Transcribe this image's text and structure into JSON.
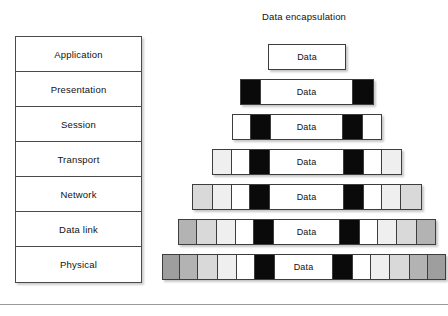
{
  "diagram": {
    "title": "Data encapsulation",
    "osi_stack": {
      "name": "OSI layer stack",
      "layers": [
        {
          "label": "Application"
        },
        {
          "label": "Presentation"
        },
        {
          "label": "Session"
        },
        {
          "label": "Transport"
        },
        {
          "label": "Network"
        },
        {
          "label": "Data link"
        },
        {
          "label": "Physical"
        }
      ]
    },
    "data_label": "Data",
    "colors": {
      "header_black": "#0a0a0a",
      "header_white": "#ffffff",
      "header_gray_light": "#efefef",
      "header_gray_mid": "#d9d9d9",
      "header_gray_dark": "#b3b3b3",
      "header_gray_darker": "#9e9e9e",
      "outline": "#3d3d3d",
      "background": "#ffffff"
    },
    "encapsulation_rows": [
      {
        "layer": "Application",
        "data_label": "Data",
        "left": 108,
        "width": 78,
        "top": 6,
        "segments_left": [],
        "segments_right": []
      },
      {
        "layer": "Presentation",
        "data_label": "Data",
        "left": 80,
        "width": 134,
        "top": 41,
        "segments_left": [
          {
            "fill": "#0a0a0a",
            "width": 20
          }
        ],
        "segments_right": [
          {
            "fill": "#0a0a0a",
            "width": 20
          }
        ]
      },
      {
        "layer": "Session",
        "data_label": "Data",
        "left": 72,
        "width": 150,
        "top": 76,
        "segments_left": [
          {
            "fill": "#ffffff",
            "width": 18
          },
          {
            "fill": "#0a0a0a",
            "width": 20
          }
        ],
        "segments_right": [
          {
            "fill": "#0a0a0a",
            "width": 20
          },
          {
            "fill": "#ffffff",
            "width": 18
          }
        ]
      },
      {
        "layer": "Transport",
        "data_label": "Data",
        "left": 52,
        "width": 190,
        "top": 111,
        "segments_left": [
          {
            "fill": "#efefef",
            "width": 19
          },
          {
            "fill": "#ffffff",
            "width": 18
          },
          {
            "fill": "#0a0a0a",
            "width": 20
          }
        ],
        "segments_right": [
          {
            "fill": "#0a0a0a",
            "width": 20
          },
          {
            "fill": "#ffffff",
            "width": 18
          },
          {
            "fill": "#efefef",
            "width": 19
          }
        ]
      },
      {
        "layer": "Network",
        "data_label": "Data",
        "left": 32,
        "width": 230,
        "top": 146,
        "segments_left": [
          {
            "fill": "#d9d9d9",
            "width": 20
          },
          {
            "fill": "#efefef",
            "width": 19
          },
          {
            "fill": "#ffffff",
            "width": 18
          },
          {
            "fill": "#0a0a0a",
            "width": 20
          }
        ],
        "segments_right": [
          {
            "fill": "#0a0a0a",
            "width": 20
          },
          {
            "fill": "#ffffff",
            "width": 18
          },
          {
            "fill": "#efefef",
            "width": 19
          },
          {
            "fill": "#d9d9d9",
            "width": 20
          }
        ]
      },
      {
        "layer": "Data link",
        "data_label": "Data",
        "left": 18,
        "width": 258,
        "top": 181,
        "segments_left": [
          {
            "fill": "#b3b3b3",
            "width": 18
          },
          {
            "fill": "#d9d9d9",
            "width": 20
          },
          {
            "fill": "#efefef",
            "width": 19
          },
          {
            "fill": "#ffffff",
            "width": 18
          },
          {
            "fill": "#0a0a0a",
            "width": 20
          }
        ],
        "segments_right": [
          {
            "fill": "#0a0a0a",
            "width": 20
          },
          {
            "fill": "#ffffff",
            "width": 18
          },
          {
            "fill": "#efefef",
            "width": 19
          },
          {
            "fill": "#d9d9d9",
            "width": 20
          },
          {
            "fill": "#b3b3b3",
            "width": 18
          }
        ]
      },
      {
        "layer": "Physical",
        "data_label": "Data",
        "left": 2,
        "width": 284,
        "top": 216,
        "segments_left": [
          {
            "fill": "#9e9e9e",
            "width": 17
          },
          {
            "fill": "#b3b3b3",
            "width": 18
          },
          {
            "fill": "#d9d9d9",
            "width": 20
          },
          {
            "fill": "#efefef",
            "width": 19
          },
          {
            "fill": "#ffffff",
            "width": 18
          },
          {
            "fill": "#0a0a0a",
            "width": 20
          }
        ],
        "segments_right": [
          {
            "fill": "#0a0a0a",
            "width": 20
          },
          {
            "fill": "#ffffff",
            "width": 18
          },
          {
            "fill": "#efefef",
            "width": 19
          },
          {
            "fill": "#d9d9d9",
            "width": 20
          },
          {
            "fill": "#b3b3b3",
            "width": 18
          },
          {
            "fill": "#9e9e9e",
            "width": 17
          }
        ]
      }
    ]
  }
}
